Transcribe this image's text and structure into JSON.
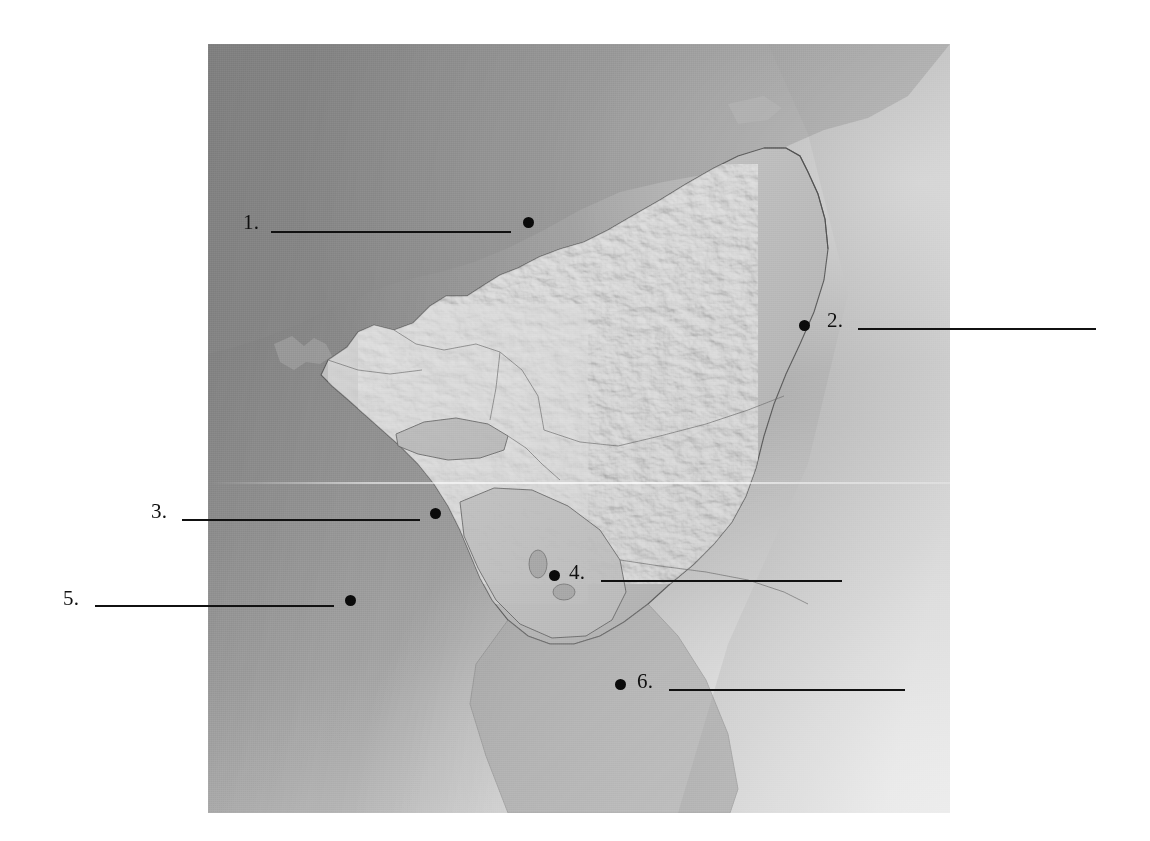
{
  "page": {
    "background_color": "#ffffff"
  },
  "map": {
    "name": "nicaragua-shaded-relief-map",
    "type": "grayscale shaded relief",
    "region": "Nicaragua and surrounding Central America",
    "frame": {
      "left": 208,
      "top": 44,
      "width": 742,
      "height": 769
    },
    "palette": {
      "land_light": "#c8c8c8",
      "land_mid": "#a9a9a9",
      "ocean_dark": "#8c8c8c",
      "ocean_light": "#d8d8d8",
      "outline": "#5a5a5a",
      "ink": "#111111"
    },
    "features": [
      "Caribbean Sea (east)",
      "Pacific Ocean (west)",
      "Lake Managua",
      "Lake Nicaragua",
      "Gulf of Fonseca",
      "Cordillera Isabelia highlands"
    ]
  },
  "callouts": [
    {
      "id": 1,
      "number": "1.",
      "number_x": 243,
      "number_y": 212,
      "line_x": 271,
      "line_y": 231,
      "line_w": 240,
      "dot_x": 523,
      "dot_y": 217,
      "answer": ""
    },
    {
      "id": 2,
      "number": "2.",
      "number_x": 827,
      "number_y": 310,
      "line_x": 858,
      "line_y": 328,
      "line_w": 238,
      "dot_x": 799,
      "dot_y": 320,
      "answer": ""
    },
    {
      "id": 3,
      "number": "3.",
      "number_x": 151,
      "number_y": 501,
      "line_x": 182,
      "line_y": 519,
      "line_w": 238,
      "dot_x": 430,
      "dot_y": 508,
      "answer": ""
    },
    {
      "id": 4,
      "number": "4.",
      "number_x": 569,
      "number_y": 562,
      "line_x": 601,
      "line_y": 580,
      "line_w": 241,
      "dot_x": 549,
      "dot_y": 570,
      "answer": ""
    },
    {
      "id": 5,
      "number": "5.",
      "number_x": 63,
      "number_y": 588,
      "line_x": 95,
      "line_y": 605,
      "line_w": 239,
      "dot_x": 345,
      "dot_y": 595,
      "answer": ""
    },
    {
      "id": 6,
      "number": "6.",
      "number_x": 637,
      "number_y": 671,
      "line_x": 669,
      "line_y": 689,
      "line_w": 236,
      "dot_x": 615,
      "dot_y": 679,
      "answer": ""
    }
  ]
}
